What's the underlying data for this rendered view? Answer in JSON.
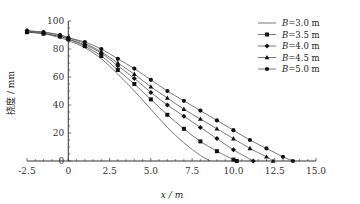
{
  "chart_data": {
    "type": "line",
    "title": "",
    "xlabel": "x / m",
    "ylabel": "挠度 / mm",
    "xlim": [
      -2.5,
      15.0
    ],
    "ylim": [
      0,
      100
    ],
    "xticks": [
      "-2.5",
      "0",
      "2.5",
      "5.0",
      "7.5",
      "10.0",
      "12.5",
      "15.0"
    ],
    "yticks": [
      "0",
      "20",
      "40",
      "60",
      "80",
      "100"
    ],
    "legend_position": "top-right",
    "grid": false,
    "series": [
      {
        "name": "B=3.0 m",
        "marker": "none",
        "x": [
          -2.5,
          -1.5,
          -0.5,
          0,
          1,
          2,
          3,
          4,
          5,
          6,
          7,
          8,
          8.6
        ],
        "y": [
          92,
          91,
          88,
          86,
          81,
          73,
          62,
          50,
          37,
          24,
          13,
          4,
          0
        ]
      },
      {
        "name": "B=3.5 m",
        "marker": "square",
        "x": [
          -2.5,
          -1.5,
          -0.5,
          0,
          1,
          2,
          3,
          4,
          5,
          6,
          7,
          8,
          9,
          10,
          10.2
        ],
        "y": [
          92,
          91,
          89,
          87,
          82,
          75,
          65,
          55,
          44,
          33,
          23,
          14,
          7,
          1,
          0
        ]
      },
      {
        "name": "B=4.0 m",
        "marker": "diamond",
        "x": [
          -2.5,
          -1.5,
          -0.5,
          0,
          1,
          2,
          3,
          4,
          5,
          6,
          7,
          8,
          9,
          10,
          11.2
        ],
        "y": [
          93,
          91,
          89,
          87,
          83,
          77,
          68,
          59,
          49,
          40,
          32,
          24,
          16,
          8,
          0
        ]
      },
      {
        "name": "B=4.5 m",
        "marker": "triangle",
        "x": [
          -2.5,
          -1.5,
          -0.5,
          0,
          1,
          2,
          3,
          4,
          5,
          6,
          7,
          8,
          9,
          10,
          11,
          12,
          12.4
        ],
        "y": [
          93,
          92,
          90,
          88,
          84,
          78,
          70,
          62,
          53,
          45,
          37,
          30,
          23,
          16,
          9,
          3,
          0
        ]
      },
      {
        "name": "B=5.0 m",
        "marker": "circle",
        "x": [
          -2.5,
          -1.5,
          -0.5,
          0,
          1,
          2,
          3,
          4,
          5,
          6,
          7,
          8,
          9,
          10,
          11,
          12,
          13,
          13.6
        ],
        "y": [
          93,
          92,
          90,
          88,
          85,
          80,
          73,
          66,
          58,
          50,
          43,
          36,
          29,
          22,
          15,
          9,
          3,
          0
        ]
      }
    ]
  }
}
